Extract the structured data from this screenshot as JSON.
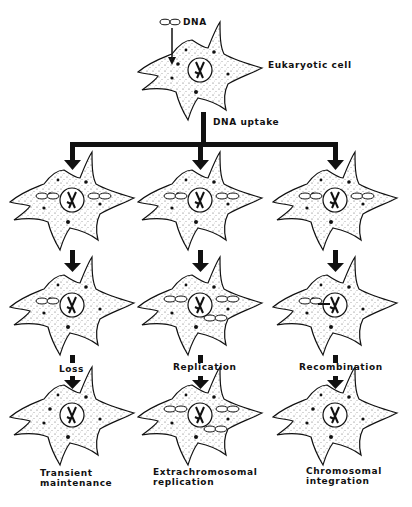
{
  "figure": {
    "top": {
      "dna_label": "DNA",
      "cell_label": "Eukaryotic cell",
      "uptake_label": "DNA uptake"
    },
    "columns": [
      {
        "id": "transient",
        "process_label": "Loss",
        "outcome_line1": "Transient",
        "outcome_line2": "maintenance"
      },
      {
        "id": "extrachromosomal",
        "process_label": "Replication",
        "outcome_line1": "Extrachromosomal",
        "outcome_line2": "replication"
      },
      {
        "id": "chromosomal",
        "process_label": "Recombination",
        "outcome_line1": "Chromosomal",
        "outcome_line2": "integration"
      }
    ],
    "colors": {
      "ink": "#111111",
      "background": "#ffffff"
    }
  }
}
